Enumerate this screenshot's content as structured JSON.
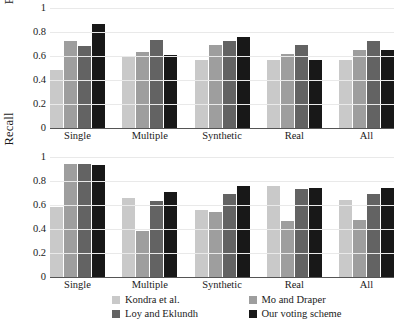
{
  "chart_data": {
    "type": "bar",
    "title": "",
    "subtitle": "",
    "categories": [
      "Single",
      "Multiple",
      "Synthetic",
      "Real",
      "All"
    ],
    "xlabel": "",
    "grid": true,
    "legend_position": "bottom",
    "panels": [
      {
        "ylabel": "Precision",
        "ylim": [
          0,
          1
        ],
        "yticks": [
          "0",
          "0.2",
          "0.4",
          "0.6",
          "0.8",
          "1"
        ],
        "ytick_values": [
          0,
          0.2,
          0.4,
          0.6,
          0.8,
          1
        ],
        "series": [
          {
            "name": "Kondra et al.",
            "color": "#c9c9c9",
            "values": [
              0.485,
              0.6,
              0.57,
              0.57,
              0.57
            ]
          },
          {
            "name": "Mo and Draper",
            "color": "#9e9e9e",
            "values": [
              0.725,
              0.63,
              0.695,
              0.62,
              0.65
            ]
          },
          {
            "name": "Loy and Eklundh",
            "color": "#636363",
            "values": [
              0.685,
              0.735,
              0.725,
              0.695,
              0.725
            ]
          },
          {
            "name": "Our voting scheme",
            "color": "#181818",
            "values": [
              0.865,
              0.61,
              0.755,
              0.565,
              0.65
            ]
          }
        ]
      },
      {
        "ylabel": "Recall",
        "ylim": [
          0,
          1
        ],
        "yticks": [
          "0",
          "0.2",
          "0.4",
          "0.6",
          "0.8",
          "1"
        ],
        "ytick_values": [
          0,
          0.2,
          0.4,
          0.6,
          0.8,
          1
        ],
        "series": [
          {
            "name": "Kondra et al.",
            "color": "#c9c9c9",
            "values": [
              0.585,
              0.66,
              0.555,
              0.755,
              0.645
            ]
          },
          {
            "name": "Mo and Draper",
            "color": "#9e9e9e",
            "values": [
              0.945,
              0.385,
              0.54,
              0.465,
              0.475
            ]
          },
          {
            "name": "Loy and Eklundh",
            "color": "#636363",
            "values": [
              0.945,
              0.63,
              0.69,
              0.73,
              0.69
            ]
          },
          {
            "name": "Our voting scheme",
            "color": "#181818",
            "values": [
              0.935,
              0.71,
              0.755,
              0.74,
              0.745
            ]
          }
        ]
      }
    ],
    "legend": [
      {
        "label": "Kondra et al.",
        "color": "#c9c9c9"
      },
      {
        "label": "Mo and Draper",
        "color": "#9e9e9e"
      },
      {
        "label": "Loy and Eklundh",
        "color": "#636363"
      },
      {
        "label": "Our voting scheme",
        "color": "#181818"
      }
    ]
  }
}
